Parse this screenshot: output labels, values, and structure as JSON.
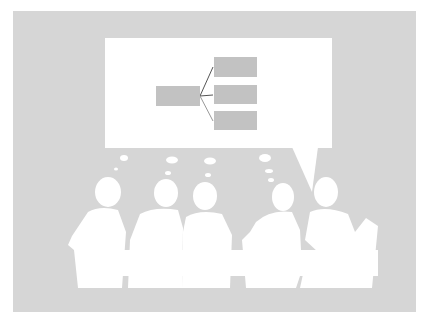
{
  "illustration": {
    "subject": "meeting-silhouettes-with-speech-bubble",
    "background_color": "#d6d6d6",
    "bubble_color": "#ffffff",
    "diagram_box_color": "#c2c2c2",
    "connector_color": "#555555",
    "diagram": {
      "root_box": {
        "x": 156,
        "y": 86,
        "w": 44,
        "h": 20
      },
      "child_boxes": [
        {
          "x": 214,
          "y": 57,
          "w": 43,
          "h": 20
        },
        {
          "x": 214,
          "y": 85,
          "w": 43,
          "h": 19
        },
        {
          "x": 214,
          "y": 111,
          "w": 43,
          "h": 19
        }
      ]
    },
    "people_count": 5
  }
}
